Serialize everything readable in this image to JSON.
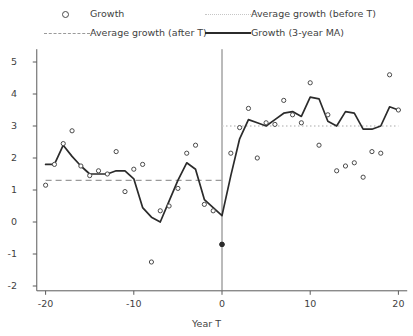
{
  "chart_data": {
    "type": "scatter",
    "title": "",
    "xlabel": "Year T",
    "ylabel": "",
    "xlim": [
      -21,
      21
    ],
    "ylim": [
      -2.4,
      5.4
    ],
    "xticks": [
      -20,
      -10,
      0,
      10,
      20
    ],
    "yticks": [
      -2,
      -1,
      0,
      1,
      2,
      3,
      4,
      5
    ],
    "grid": false,
    "legend_position": "above-plot",
    "reference_lines": [
      {
        "name": "Average growth (before T)",
        "value": 3.0,
        "style": "dotted",
        "color": "#c6c6c6",
        "x_from": 0,
        "x_to": 20
      },
      {
        "name": "Average growth (after T)",
        "value": 1.3,
        "style": "dashed",
        "color": "#9a9a9a",
        "x_from": -20,
        "x_to": 0
      }
    ],
    "event_line_x": 0,
    "series": [
      {
        "name": "Growth",
        "type": "scatter",
        "marker": "open-circle",
        "x": [
          -20,
          -19,
          -18,
          -17,
          -16,
          -15,
          -14,
          -13,
          -12,
          -11,
          -10,
          -9,
          -8,
          -7,
          -6,
          -5,
          -4,
          -3,
          -2,
          -1,
          0,
          1,
          2,
          3,
          4,
          5,
          6,
          7,
          8,
          9,
          10,
          11,
          12,
          13,
          14,
          15,
          16,
          17,
          18,
          19,
          20
        ],
        "y": [
          1.15,
          1.8,
          2.45,
          2.85,
          1.75,
          1.45,
          1.6,
          1.5,
          2.2,
          0.95,
          1.65,
          1.8,
          -1.25,
          0.35,
          0.5,
          1.05,
          2.15,
          2.4,
          0.55,
          0.35,
          -0.7,
          2.15,
          2.95,
          3.55,
          2.0,
          3.1,
          3.05,
          3.8,
          3.35,
          3.1,
          4.35,
          2.4,
          3.35,
          1.6,
          1.75,
          1.85,
          1.4,
          2.2,
          2.15,
          4.6,
          3.5
        ]
      },
      {
        "name": "Growth (3-year MA)",
        "type": "line",
        "color": "#2b2b2b",
        "x": [
          -20,
          -19,
          -18,
          -17,
          -16,
          -15,
          -14,
          -13,
          -12,
          -11,
          -10,
          -9,
          -8,
          -7,
          -6,
          -5,
          -4,
          -3,
          -2,
          -1,
          0,
          1,
          2,
          3,
          4,
          5,
          6,
          7,
          8,
          9,
          10,
          11,
          12,
          13,
          14,
          15,
          16,
          17,
          18,
          19,
          20
        ],
        "y": [
          1.8,
          1.8,
          2.4,
          2.05,
          1.75,
          1.5,
          1.5,
          1.5,
          1.6,
          1.6,
          1.35,
          0.45,
          0.15,
          0.0,
          0.65,
          1.3,
          1.85,
          1.65,
          0.7,
          0.45,
          0.2,
          1.45,
          2.6,
          3.2,
          3.1,
          3.0,
          3.2,
          3.4,
          3.45,
          3.3,
          3.9,
          3.85,
          3.15,
          3.0,
          3.45,
          3.4,
          2.9,
          2.9,
          3.0,
          3.6,
          3.5
        ]
      }
    ],
    "special_points": [
      {
        "x": 0,
        "y": -0.7,
        "marker": "filled-circle",
        "color": "#2b2b2b"
      }
    ]
  },
  "legend": {
    "items": [
      {
        "label": "Growth",
        "key": "open-circle-marker"
      },
      {
        "label": "Average growth (before T)",
        "key": "dotted-line"
      },
      {
        "label": "Average growth (after T)",
        "key": "dashed-line"
      },
      {
        "label": "Growth (3-year MA)",
        "key": "solid-line"
      }
    ]
  },
  "colors": {
    "axis": "#5a5a5a",
    "line": "#2b2b2b",
    "marker_stroke": "#4a4a4a",
    "dashed": "#9a9a9a",
    "dotted": "#c6c6c6"
  }
}
